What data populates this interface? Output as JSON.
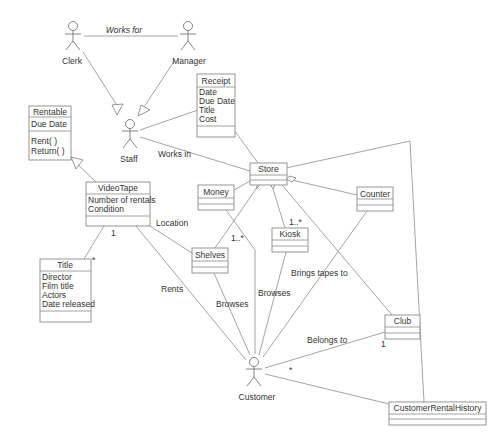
{
  "diagram": {
    "type": "UML class/use-case diagram",
    "actors": [
      {
        "id": "clerk",
        "label": "Clerk"
      },
      {
        "id": "manager",
        "label": "Manager"
      },
      {
        "id": "staff",
        "label": "Staff"
      },
      {
        "id": "customer",
        "label": "Customer"
      }
    ],
    "classes": {
      "rentable": {
        "name": "Rentable",
        "attributes": [
          "Due Date"
        ],
        "methods": [
          "Rent( )",
          "Return( )"
        ]
      },
      "receipt": {
        "name": "Receipt",
        "attributes": [
          "Date",
          "Due Date",
          "Title",
          "Cost"
        ],
        "methods": []
      },
      "videotape": {
        "name": "VideoTape",
        "attributes": [
          "Number of rentals",
          "Condition"
        ],
        "methods": []
      },
      "title": {
        "name": "Title",
        "attributes": [
          "Director",
          "Film title",
          "Actors",
          "Date released"
        ],
        "methods": []
      },
      "store": {
        "name": "Store",
        "attributes": [],
        "methods": []
      },
      "money": {
        "name": "Money",
        "attributes": [],
        "methods": []
      },
      "shelves": {
        "name": "Shelves",
        "attributes": [],
        "methods": []
      },
      "kiosk": {
        "name": "Kiosk",
        "attributes": [],
        "methods": []
      },
      "counter": {
        "name": "Counter",
        "attributes": [],
        "methods": []
      },
      "club": {
        "name": "Club",
        "attributes": [],
        "methods": []
      },
      "history": {
        "name": "CustomerRentalHistory",
        "attributes": [],
        "methods": []
      }
    },
    "labels": {
      "works_for": "Works for",
      "works_in": "Works in",
      "location": "Location",
      "rents": "Rents",
      "browses_1": "Browses",
      "browses_2": "Browses",
      "brings_tapes_to": "Brings tapes to",
      "belongs_to": "Belongs ",
      "belongs_to_italic": "to"
    },
    "multiplicities": {
      "videotape_title_1": "1",
      "videotape_title_star": "*",
      "shelves": "1..*",
      "kiosk": "1..*",
      "club_1": "1",
      "customer_star": "*"
    }
  }
}
